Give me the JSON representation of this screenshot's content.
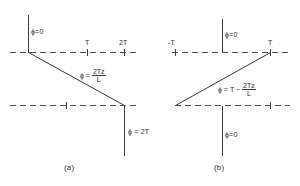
{
  "figure": {
    "type": "engineering-diagram",
    "panels": [
      {
        "id": "a",
        "caption": "(a)",
        "labels": {
          "top_boundary": "ϕ=0",
          "bottom_boundary": "ϕ = 2T",
          "diagonal_eq_lead": "ϕ =",
          "diagonal_eq_numerator": "2Tz",
          "diagonal_eq_denominator": "L"
        },
        "axis_ticks": [
          {
            "label": "T",
            "x": 87
          },
          {
            "label": "2T",
            "x": 124
          }
        ]
      },
      {
        "id": "b",
        "caption": "(b)",
        "labels": {
          "top_boundary": "ϕ=0",
          "bottom_boundary": "ϕ=0",
          "diagonal_eq_lead": "ϕ = T −",
          "diagonal_eq_numerator": "2Tz",
          "diagonal_eq_denominator": "L"
        },
        "axis_ticks": [
          {
            "label": "-T",
            "x": 175
          },
          {
            "label": "T",
            "x": 270
          }
        ]
      }
    ],
    "colors": {
      "line": "#3a3a3a",
      "dash": "#4a4a4a",
      "text": "#2e2e2e",
      "background": "#ffffff"
    }
  }
}
